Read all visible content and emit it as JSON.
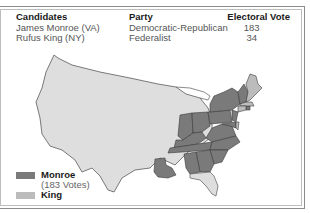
{
  "colors": {
    "monroe": "#7a7a7a",
    "king": "#bcbcbc",
    "land": "#dedede",
    "state_border": "#4a4a4a",
    "frame": "#8c8c8c"
  },
  "table": {
    "headers": {
      "candidates": "Candidates",
      "party": "Party",
      "electoral_vote": "Electoral Vote"
    },
    "rows": [
      {
        "candidate": "James Monroe (VA)",
        "party": "Democratic-Republican",
        "electoral_vote": "183"
      },
      {
        "candidate": "Rufus King (NY)",
        "party": "Federalist",
        "electoral_vote": "34"
      }
    ]
  },
  "legend": {
    "items": [
      {
        "label": "Monroe",
        "sub": "(183 Votes)",
        "color_key": "monroe"
      },
      {
        "label": "King",
        "sub": "",
        "color_key": "king"
      }
    ]
  },
  "map": {
    "title_context": "Election of 1816",
    "regions": [
      {
        "name": "Western territories",
        "winner": "none"
      },
      {
        "name": "Eastern states",
        "winner": "Monroe"
      },
      {
        "name": "Louisiana",
        "winner": "Monroe"
      },
      {
        "name": "Massachusetts",
        "winner": "King"
      },
      {
        "name": "Connecticut",
        "winner": "King"
      },
      {
        "name": "Delaware",
        "winner": "King"
      }
    ]
  }
}
